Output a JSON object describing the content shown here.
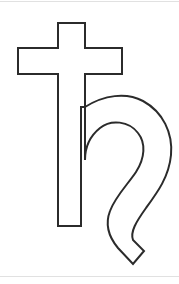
{
  "page": {
    "width": 179,
    "height": 284,
    "background_color": "#ffffff"
  },
  "figure": {
    "name": "saturn-symbol",
    "stroke_color": "#2b2b2b",
    "fill_color": "#ffffff",
    "stroke_width": 2,
    "glyph": "♄",
    "alt_text": "Saturn symbol"
  },
  "artifacts": {
    "scan_edge_color": "#c9c9c9",
    "scan_edge_top_label": "scan edge line top",
    "scan_edge_bottom_label": "scan edge line bottom"
  },
  "geometry": {
    "cross": {
      "stem_left": 58,
      "stem_right": 85,
      "stem_top": 23,
      "stem_bottom": 226,
      "arm_left": 18,
      "arm_right": 122,
      "arm_top": 48,
      "arm_bottom": 74
    },
    "hook": {
      "start_x": 85,
      "start_y": 107,
      "outer_max_x": 172,
      "tail_tip_x": 133,
      "tail_tip_y": 264,
      "inner_loop_center_x": 112,
      "inner_loop_center_y": 152
    }
  }
}
